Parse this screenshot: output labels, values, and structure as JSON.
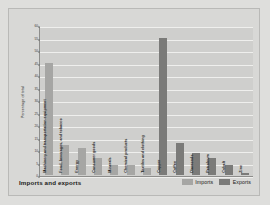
{
  "footer": {
    "title": "Imports and exports"
  },
  "legend": [
    {
      "label": "Imports",
      "color": "#a6a6a4",
      "key": "imports"
    },
    {
      "label": "Exports",
      "color": "#7b7b79",
      "key": "exports"
    }
  ],
  "chart_data": {
    "type": "bar",
    "title": "Imports and exports",
    "xlabel": "",
    "ylabel": "Percentage of total",
    "ylim": [
      0,
      60
    ],
    "yticks": [
      0,
      5,
      10,
      15,
      20,
      25,
      30,
      35,
      40,
      45,
      50,
      55,
      60
    ],
    "grid": true,
    "legend_position": "bottom-right",
    "categories": [
      "Machinery and transportation equipment",
      "Food, beverages, and tobacco",
      "Energy",
      "Consumer goods",
      "Minerals",
      "Chemical products",
      "Textiles and clothing",
      "Copper",
      "Coffee",
      "Diamonds",
      "Petroleum",
      "Cobalt",
      "Zinc"
    ],
    "series": [
      {
        "name": "Imports",
        "color": "#a6a6a4",
        "values": [
          45,
          12,
          11,
          7,
          4,
          4,
          3,
          null,
          null,
          null,
          null,
          null,
          null
        ]
      },
      {
        "name": "Exports",
        "color": "#7b7b79",
        "values": [
          null,
          null,
          null,
          null,
          null,
          null,
          null,
          55,
          13,
          9,
          7,
          4,
          1
        ]
      }
    ],
    "bars": [
      {
        "category": "Machinery and transportation equipment",
        "series": "imports",
        "value": 45
      },
      {
        "category": "Food, beverages, and tobacco",
        "series": "imports",
        "value": 12
      },
      {
        "category": "Energy",
        "series": "imports",
        "value": 11
      },
      {
        "category": "Consumer goods",
        "series": "imports",
        "value": 7
      },
      {
        "category": "Minerals",
        "series": "imports",
        "value": 4
      },
      {
        "category": "Chemical products",
        "series": "imports",
        "value": 4
      },
      {
        "category": "Textiles and clothing",
        "series": "imports",
        "value": 3
      },
      {
        "category": "Copper",
        "series": "exports",
        "value": 55
      },
      {
        "category": "Coffee",
        "series": "exports",
        "value": 13
      },
      {
        "category": "Diamonds",
        "series": "exports",
        "value": 9
      },
      {
        "category": "Petroleum",
        "series": "exports",
        "value": 7
      },
      {
        "category": "Cobalt",
        "series": "exports",
        "value": 4
      },
      {
        "category": "Zinc",
        "series": "exports",
        "value": 1
      }
    ]
  }
}
